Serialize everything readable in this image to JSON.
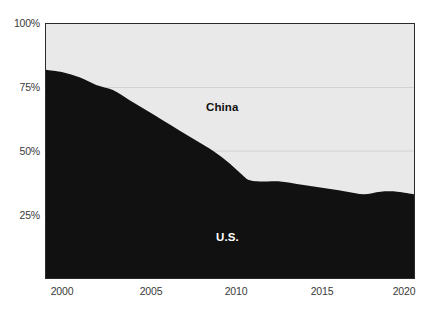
{
  "chart_data": {
    "type": "area",
    "title": "",
    "subtitle": "",
    "xlabel": "",
    "ylabel": "",
    "stacked": true,
    "normalized_to_100_percent": true,
    "grid": true,
    "grid_axis": "y",
    "legend_position": "inline-labels",
    "xlim": [
      1999,
      2021
    ],
    "ylim": [
      0,
      100
    ],
    "y_tick_values": [
      100,
      75,
      50,
      25
    ],
    "y_tick_labels": [
      "100%",
      "75%",
      "50%",
      "25%"
    ],
    "x_tick_values": [
      2000,
      2005,
      2010,
      2015,
      2020
    ],
    "x_tick_labels": [
      "2000",
      "2005",
      "2010",
      "2015",
      "2020"
    ],
    "colors": {
      "us_fill": "#111111",
      "china_fill": "#e9e9e9",
      "axis": "#2b2b2b",
      "gridline": "#d2d2d2",
      "tick_text": "#3a3a3a",
      "china_label_text": "#111111",
      "us_label_text": "#ffffff",
      "page_background": "#ffffff"
    },
    "x": [
      1999,
      2000,
      2001,
      2002,
      2003,
      2004,
      2005,
      2006,
      2007,
      2008,
      2009,
      2010,
      2011,
      2012,
      2013,
      2014,
      2015,
      2016,
      2017,
      2018,
      2019,
      2020,
      2021
    ],
    "series": [
      {
        "name": "U.S.",
        "label": "U.S.",
        "color": "#111111",
        "values": [
          82,
          81,
          79,
          76,
          74,
          70,
          66,
          62,
          58,
          54,
          50,
          45,
          39,
          38,
          38,
          37,
          36,
          35,
          34,
          33,
          34,
          34,
          33
        ]
      },
      {
        "name": "China",
        "label": "China",
        "color": "#e9e9e9",
        "values": [
          18,
          19,
          21,
          24,
          26,
          30,
          34,
          38,
          42,
          46,
          50,
          55,
          61,
          62,
          62,
          63,
          64,
          65,
          66,
          67,
          66,
          66,
          67
        ]
      }
    ],
    "annotations": [
      {
        "text": "China",
        "x": 2008,
        "y": 81
      },
      {
        "text": "U.S.",
        "x": 2008,
        "y": 20
      }
    ]
  },
  "axes": {
    "y_labels": [
      {
        "text": "100%",
        "top_px": 18
      },
      {
        "text": "75%",
        "top_px": 82
      },
      {
        "text": "50%",
        "top_px": 146
      },
      {
        "text": "25%",
        "top_px": 210
      }
    ],
    "x_labels": [
      {
        "text": "2000",
        "left_px": 17
      },
      {
        "text": "2005",
        "left_px": 106
      },
      {
        "text": "2010",
        "left_px": 191
      },
      {
        "text": "2015",
        "left_px": 277
      },
      {
        "text": "2020",
        "left_px": 359
      }
    ]
  },
  "series_labels": {
    "china": "China",
    "us": "U.S."
  }
}
